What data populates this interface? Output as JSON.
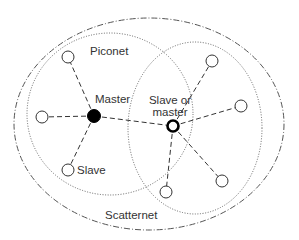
{
  "labels": {
    "piconet": "Piconet",
    "master": "Master",
    "slave_or_master_line1": "Slave or",
    "slave_or_master_line2": "master",
    "slave": "Slave",
    "scatternet": "Scatternet"
  },
  "colors": {
    "stroke": "#333333",
    "boundary": "#555555",
    "master_fill": "#000000",
    "background": "#ffffff"
  },
  "nodes": [
    {
      "id": "master",
      "role": "master",
      "x": 94,
      "y": 116
    },
    {
      "id": "bridge",
      "role": "slave-or-master",
      "x": 173,
      "y": 126
    },
    {
      "id": "s1",
      "role": "slave",
      "x": 68,
      "y": 57
    },
    {
      "id": "s2",
      "role": "slave",
      "x": 42,
      "y": 117
    },
    {
      "id": "s3",
      "role": "slave",
      "x": 68,
      "y": 170
    },
    {
      "id": "s4",
      "role": "slave",
      "x": 212,
      "y": 61
    },
    {
      "id": "s5",
      "role": "slave",
      "x": 241,
      "y": 106
    },
    {
      "id": "s6",
      "role": "slave",
      "x": 222,
      "y": 181
    },
    {
      "id": "s7",
      "role": "slave",
      "x": 166,
      "y": 192
    }
  ],
  "links": [
    [
      "master",
      "s1"
    ],
    [
      "master",
      "s2"
    ],
    [
      "master",
      "s3"
    ],
    [
      "master",
      "bridge"
    ],
    [
      "bridge",
      "s4"
    ],
    [
      "bridge",
      "s5"
    ],
    [
      "bridge",
      "s6"
    ],
    [
      "bridge",
      "s7"
    ]
  ]
}
